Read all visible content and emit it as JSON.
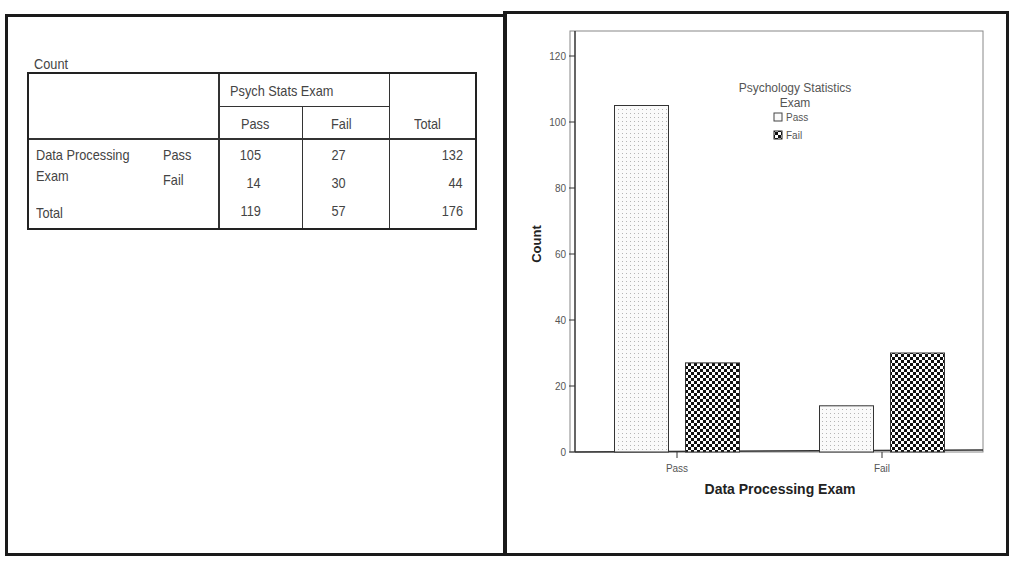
{
  "table": {
    "caption": "Count",
    "column_group_header": "Psych Stats Exam",
    "columns": [
      "Pass",
      "Fail",
      "Total"
    ],
    "row_group_label_line1": "Data Processing",
    "row_group_label_line2": "Exam",
    "rows": [
      {
        "label": "Pass",
        "values": [
          "105",
          "27",
          "132"
        ]
      },
      {
        "label": "Fail",
        "values": [
          "14",
          "30",
          "44"
        ]
      }
    ],
    "total_row": {
      "label": "Total",
      "values": [
        "119",
        "57",
        "176"
      ]
    }
  },
  "chart_data": {
    "type": "bar",
    "title": "",
    "categories": [
      "Pass",
      "Fail"
    ],
    "series": [
      {
        "name": "Pass",
        "values": [
          105,
          14
        ],
        "pattern": "stipple"
      },
      {
        "name": "Fail",
        "values": [
          27,
          30
        ],
        "pattern": "checker"
      }
    ],
    "xlabel": "Data Processing Exam",
    "ylabel": "Count",
    "ylim": [
      0,
      120
    ],
    "yticks": [
      0,
      20,
      40,
      60,
      80,
      100,
      120
    ],
    "legend": {
      "title_line1": "Psychology Statistics",
      "title_line2": "Exam",
      "entries": [
        "Pass",
        "Fail"
      ],
      "position": "upper-center-inside"
    },
    "grid": false
  }
}
